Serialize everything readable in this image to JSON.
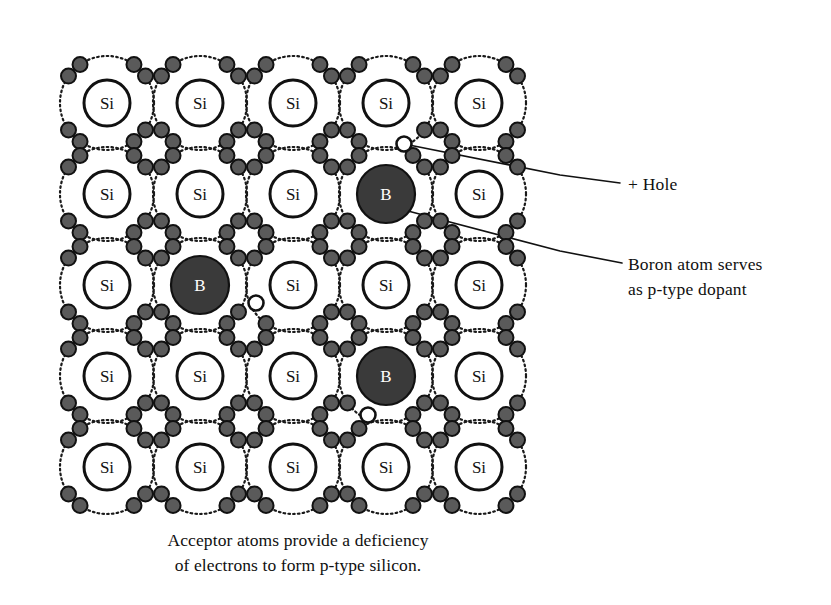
{
  "figure": {
    "kind": "semiconductor-lattice-diagram",
    "caption_line1": "Acceptor atoms provide a deficiency",
    "caption_line2": "of electrons to form p-type silicon."
  },
  "callouts": [
    {
      "id": "hole-callout",
      "text": "+ Hole",
      "text_x": 628,
      "text_y": 172,
      "leader": [
        [
          404,
          144
        ],
        [
          560,
          175
        ],
        [
          620,
          183
        ]
      ]
    },
    {
      "id": "boron-callout",
      "text_line1": "Boron atom serves",
      "text_line2": "as p-type dopant",
      "text_x": 628,
      "text_y": 252,
      "leader": [
        [
          408,
          211
        ],
        [
          560,
          251
        ],
        [
          622,
          263
        ]
      ]
    }
  ],
  "lattice": {
    "rows": 5,
    "cols": 5,
    "origin_x": 107,
    "origin_y": 103,
    "step_x": 93,
    "step_y": 91,
    "core_radius": 23,
    "boron_radius": 29,
    "orbit_radius": 47,
    "electron_radius": 7.5,
    "hole_radius": 7.5,
    "electron_angles_deg": [
      55,
      125,
      145,
      215,
      235,
      305,
      325,
      35
    ],
    "colors": {
      "core_stroke": "#111111",
      "core_fill": "#ffffff",
      "orbit_stroke": "#1a1a1a",
      "electron_fill": "#5a5a5a",
      "electron_stroke": "#111111",
      "boron_fill": "#3a3a3a",
      "boron_stroke": "#111111",
      "hole_fill": "#ffffff",
      "hole_stroke": "#111111",
      "leader_stroke": "#111111"
    },
    "atoms": [
      {
        "row": 0,
        "col": 0,
        "symbol": "Si",
        "type": "silicon"
      },
      {
        "row": 0,
        "col": 1,
        "symbol": "Si",
        "type": "silicon"
      },
      {
        "row": 0,
        "col": 2,
        "symbol": "Si",
        "type": "silicon"
      },
      {
        "row": 0,
        "col": 3,
        "symbol": "Si",
        "type": "silicon"
      },
      {
        "row": 0,
        "col": 4,
        "symbol": "Si",
        "type": "silicon"
      },
      {
        "row": 1,
        "col": 0,
        "symbol": "Si",
        "type": "silicon"
      },
      {
        "row": 1,
        "col": 1,
        "symbol": "Si",
        "type": "silicon"
      },
      {
        "row": 1,
        "col": 2,
        "symbol": "Si",
        "type": "silicon"
      },
      {
        "row": 1,
        "col": 3,
        "symbol": "B",
        "type": "boron"
      },
      {
        "row": 1,
        "col": 4,
        "symbol": "Si",
        "type": "silicon"
      },
      {
        "row": 2,
        "col": 0,
        "symbol": "Si",
        "type": "silicon"
      },
      {
        "row": 2,
        "col": 1,
        "symbol": "B",
        "type": "boron"
      },
      {
        "row": 2,
        "col": 2,
        "symbol": "Si",
        "type": "silicon"
      },
      {
        "row": 2,
        "col": 3,
        "symbol": "Si",
        "type": "silicon"
      },
      {
        "row": 2,
        "col": 4,
        "symbol": "Si",
        "type": "silicon"
      },
      {
        "row": 3,
        "col": 0,
        "symbol": "Si",
        "type": "silicon"
      },
      {
        "row": 3,
        "col": 1,
        "symbol": "Si",
        "type": "silicon"
      },
      {
        "row": 3,
        "col": 2,
        "symbol": "Si",
        "type": "silicon"
      },
      {
        "row": 3,
        "col": 3,
        "symbol": "B",
        "type": "boron"
      },
      {
        "row": 3,
        "col": 4,
        "symbol": "Si",
        "type": "silicon"
      },
      {
        "row": 4,
        "col": 0,
        "symbol": "Si",
        "type": "silicon"
      },
      {
        "row": 4,
        "col": 1,
        "symbol": "Si",
        "type": "silicon"
      },
      {
        "row": 4,
        "col": 2,
        "symbol": "Si",
        "type": "silicon"
      },
      {
        "row": 4,
        "col": 3,
        "symbol": "Si",
        "type": "silicon"
      },
      {
        "row": 4,
        "col": 4,
        "symbol": "Si",
        "type": "silicon"
      }
    ],
    "holes": [
      {
        "id": "hole-1",
        "x": 404,
        "y": 144
      },
      {
        "id": "hole-2",
        "x": 256,
        "y": 303
      },
      {
        "id": "hole-3",
        "x": 368,
        "y": 415
      }
    ]
  }
}
